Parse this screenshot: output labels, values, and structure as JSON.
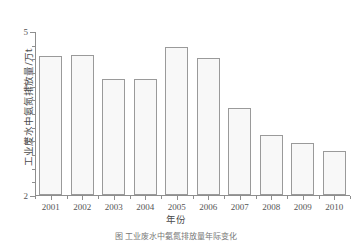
{
  "chart_data": {
    "type": "bar",
    "title": "",
    "categories": [
      "2001",
      "2002",
      "2003",
      "2004",
      "2005",
      "2006",
      "2007",
      "2008",
      "2009",
      "2010"
    ],
    "values": [
      4.55,
      4.57,
      4.13,
      4.13,
      4.7,
      4.5,
      3.6,
      3.1,
      2.95,
      2.8
    ],
    "xlabel": "年份",
    "ylabel": "工业废水中氨氮排放量/万t",
    "ylim": [
      2,
      5
    ],
    "yticks": [
      2,
      3,
      4,
      5
    ],
    "ytick_labels": [
      "2",
      "3",
      "4",
      "5"
    ],
    "yminor_ticks": [
      2.25,
      2.5,
      2.75,
      3.25,
      3.5,
      3.75,
      4.25,
      4.5,
      4.75
    ],
    "grid": false,
    "legend": null,
    "bar_fill_color": "#f8f8f8",
    "bar_edge_color": "#9a9a9a",
    "axis_color": "#8e8e8e",
    "text_color": "#555555"
  },
  "caption": {
    "text": "图  工业废水中氨氮排放量年际变化"
  }
}
